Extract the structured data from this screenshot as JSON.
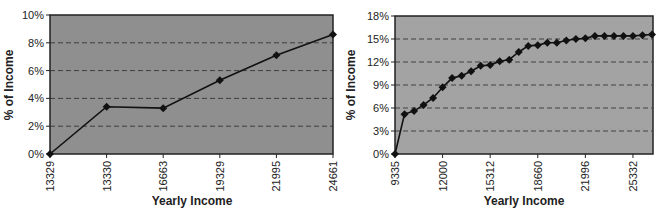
{
  "chart_data": [
    {
      "type": "line",
      "title": "",
      "xlabel": "Yearly Income",
      "ylabel": "% of Income",
      "ylim": [
        0,
        10
      ],
      "y_ticks": [
        "0%",
        "2%",
        "4%",
        "6%",
        "8%",
        "10%"
      ],
      "x_tick_labels": [
        "13329",
        "13330",
        "16663",
        "19329",
        "21995",
        "24661"
      ],
      "grid": "horizontal dashed",
      "legend": "none",
      "series": [
        {
          "name": "% of Income",
          "x": [
            "13329",
            "13330",
            "16663",
            "19329",
            "21995",
            "24661"
          ],
          "values": [
            0.0,
            3.4,
            3.3,
            5.3,
            7.1,
            8.6
          ]
        }
      ]
    },
    {
      "type": "line",
      "title": "",
      "xlabel": "Yearly Income",
      "ylabel": "% of Income",
      "ylim": [
        0,
        18
      ],
      "y_ticks": [
        "0%",
        "3%",
        "6%",
        "9%",
        "12%",
        "15%",
        "18%"
      ],
      "x_tick_labels": [
        "9335",
        "12000",
        "15312",
        "18660",
        "21996",
        "25332"
      ],
      "x_tick_label_indices": [
        0,
        5,
        10,
        15,
        20,
        25
      ],
      "grid": "horizontal dashed",
      "legend": "none",
      "series": [
        {
          "name": "% of Income",
          "values": [
            0.0,
            5.2,
            5.6,
            6.4,
            7.3,
            8.7,
            9.9,
            10.2,
            10.8,
            11.5,
            11.6,
            12.1,
            12.3,
            13.3,
            14.1,
            14.2,
            14.5,
            14.5,
            14.8,
            15.0,
            15.1,
            15.4,
            15.4,
            15.4,
            15.4,
            15.4,
            15.5,
            15.6
          ]
        }
      ]
    }
  ],
  "charts": {
    "left": {
      "xlabel": "Yearly Income",
      "ylabel": "% of Income",
      "yticks": [
        "10%",
        "8%",
        "6%",
        "4%",
        "2%",
        "0%"
      ],
      "xticks": [
        "13329",
        "13330",
        "16663",
        "19329",
        "21995",
        "24661"
      ]
    },
    "right": {
      "xlabel": "Yearly Income",
      "ylabel": "% of Income",
      "yticks": [
        "18%",
        "15%",
        "12%",
        "9%",
        "6%",
        "3%",
        "0%"
      ],
      "xticks": [
        "9335",
        "12000",
        "15312",
        "18660",
        "21996",
        "25332"
      ]
    }
  },
  "colors": {
    "plot_bg_left": "#8f8f8f",
    "plot_bg_right": "#a3a3a3",
    "line": "#111111",
    "grid": "#333333",
    "border": "#222222"
  }
}
